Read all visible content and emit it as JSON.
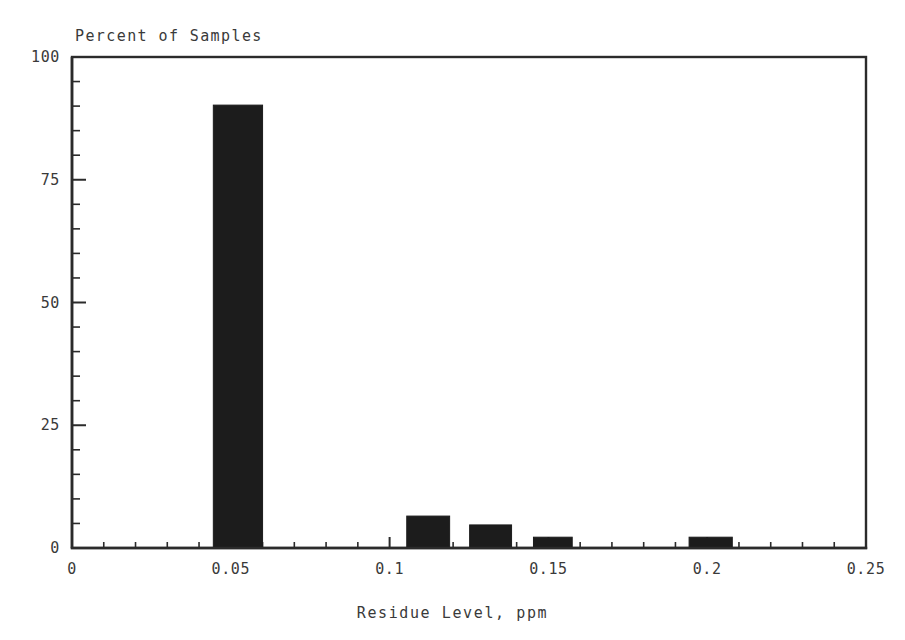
{
  "chart_data": {
    "type": "bar",
    "title": "Percent of Samples",
    "xlabel": "Residue Level, ppm",
    "ylabel": "Percent of Samples",
    "grid": false,
    "legend": null,
    "xlim": [
      0,
      0.25
    ],
    "ylim": [
      0,
      100
    ],
    "x_major_ticks": [
      0,
      0.05,
      0.1,
      0.15,
      0.2,
      0.25
    ],
    "x_tick_labels": [
      "0",
      "0.05",
      "0.1",
      "0.15",
      "0.2",
      "0.25"
    ],
    "x_minor_step": 0.01,
    "y_major_ticks": [
      0,
      25,
      50,
      75,
      100
    ],
    "y_tick_labels": [
      "0",
      "25",
      "50",
      "75",
      "100"
    ],
    "y_minor_step": 5,
    "bar_color": "#1c1c1c",
    "axis_color": "#2b2b2b",
    "bars": [
      {
        "x_start": 0.0445,
        "x_end": 0.06,
        "center": 0.0522,
        "value": 90.2
      },
      {
        "x_start": 0.1054,
        "x_end": 0.1189,
        "center": 0.1122,
        "value": 6.5
      },
      {
        "x_start": 0.1252,
        "x_end": 0.1384,
        "center": 0.1318,
        "value": 4.7
      },
      {
        "x_start": 0.1453,
        "x_end": 0.1575,
        "center": 0.1514,
        "value": 2.2
      },
      {
        "x_start": 0.1943,
        "x_end": 0.2079,
        "center": 0.2011,
        "value": 2.2
      }
    ],
    "categories": [
      "0.05",
      "0.11",
      "0.13",
      "0.15",
      "0.20"
    ],
    "values": [
      90.2,
      6.5,
      4.7,
      2.2,
      2.2
    ]
  },
  "figure": {
    "background": "#ffffff",
    "plot_left_px": 72,
    "plot_right_px": 866,
    "plot_top_px": 57,
    "plot_bottom_px": 548
  }
}
